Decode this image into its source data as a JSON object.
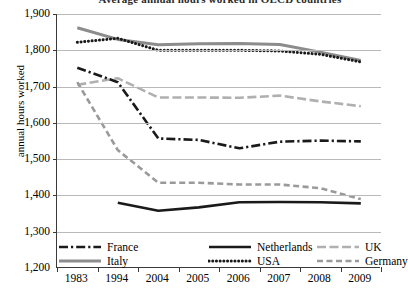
{
  "chart_data": {
    "type": "line",
    "title": "Average annual hours worked in OECD countries",
    "xlabel": "",
    "ylabel": "annual hours worked",
    "categories": [
      "1983",
      "1994",
      "2004",
      "2005",
      "2006",
      "2007",
      "2008",
      "2009"
    ],
    "ylim": [
      1200,
      1900
    ],
    "ytick_labels": [
      "1,900",
      "1,800",
      "1,700",
      "1,600",
      "1,500",
      "1,400",
      "1,300",
      "1,200"
    ],
    "ytick_values": [
      1900,
      1800,
      1700,
      1600,
      1500,
      1400,
      1300,
      1200
    ],
    "grid": "horizontal",
    "legend_position": "bottom",
    "series": [
      {
        "name": "France",
        "style": "dash-dot",
        "color": "#1a1a1a",
        "values": [
          1752,
          1712,
          1557,
          1553,
          1530,
          1548,
          1551,
          1549
        ]
      },
      {
        "name": "Netherlands",
        "style": "solid",
        "color": "#1a1a1a",
        "values": [
          null,
          1380,
          1358,
          1367,
          1381,
          1382,
          1381,
          1378
        ]
      },
      {
        "name": "UK",
        "style": "dashed-light",
        "color": "#b0b0b0",
        "values": [
          1705,
          1723,
          1670,
          1670,
          1669,
          1675,
          1659,
          1646
        ]
      },
      {
        "name": "Italy",
        "style": "solid-gray",
        "color": "#8c8c8c",
        "values": [
          1862,
          1830,
          1815,
          1818,
          1819,
          1816,
          1795,
          1772
        ]
      },
      {
        "name": "USA",
        "style": "dotted",
        "color": "#1a1a1a",
        "values": [
          1822,
          1833,
          1800,
          1800,
          1800,
          1798,
          1789,
          1768
        ]
      },
      {
        "name": "Germany",
        "style": "dashed",
        "color": "#9a9a9a",
        "values": [
          1712,
          1525,
          1435,
          1435,
          1430,
          1430,
          1420,
          1390
        ]
      }
    ]
  },
  "legend": {
    "items": [
      {
        "label": "France",
        "marker": "dash-dot-line-icon"
      },
      {
        "label": "Netherlands",
        "marker": "solid-line-icon"
      },
      {
        "label": "UK",
        "marker": "dashed-light-line-icon"
      },
      {
        "label": "Italy",
        "marker": "solid-gray-line-icon"
      },
      {
        "label": "USA",
        "marker": "dotted-line-icon"
      },
      {
        "label": "Germany",
        "marker": "dashed-line-icon"
      }
    ]
  }
}
